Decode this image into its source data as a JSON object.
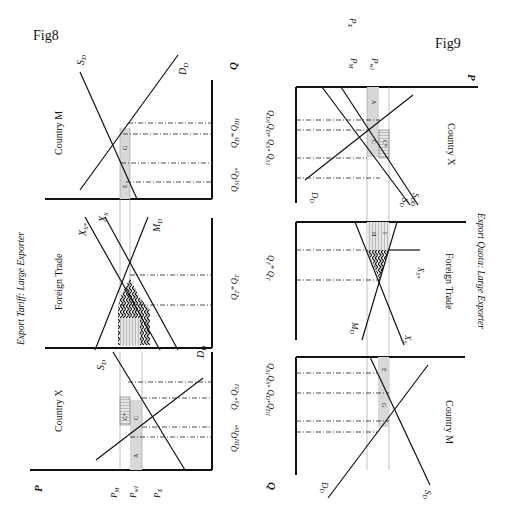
{
  "fig8": {
    "label": "Fig8",
    "title": "Export Tariff: Large Exporter",
    "panels": {
      "country_m": {
        "title": "Country M",
        "curves": [
          "S_D",
          "D_D"
        ],
        "areas": [
          "G",
          "E"
        ],
        "q_labels": [
          "Q_D1 Q_D*",
          "Q_S* Q_S1"
        ],
        "axis_q": "Q"
      },
      "foreign_trade": {
        "title": "Foreign Trade",
        "curves": [
          "X_S*",
          "X_S",
          "M_D"
        ],
        "areas": [
          "H",
          "I"
        ],
        "q_labels": [
          "Q_T* Q_T"
        ]
      },
      "country_x": {
        "title": "Country X",
        "curves": [
          "S_D",
          "D_D"
        ],
        "areas": [
          "A",
          "C",
          "C*"
        ],
        "q_labels": [
          "Q_D1 Q_D*",
          "Q_S* Q_S1"
        ],
        "axis_p": "P",
        "price_labels": [
          "P_M",
          "P_w1",
          "P_X"
        ]
      }
    },
    "text": {
      "fig": "Fig8",
      "title": "Export Tariff: Large Exporter",
      "cm": "Country M",
      "ft": "Foreign Trade",
      "cx": "Country X",
      "sd": "S",
      "dd": "D",
      "sub_d": "D",
      "xs": "X",
      "sub_s": "S",
      "sub_sstar": "S*",
      "md": "M",
      "q": "Q",
      "p": "P",
      "pm": "P",
      "pm_sub": "M",
      "pw": "P",
      "pw_sub": "w1",
      "px": "P",
      "px_sub": "X",
      "qm1": "Q_D* Q_D1",
      "qm2": "Q_S1 Q_S*",
      "qt": "Q_T* Q_T",
      "qx1": "Q_D1 Q_D*",
      "qx2": "Q_S* Q_S1",
      "a": "A",
      "c": "C",
      "cs": "C*",
      "e": "E",
      "g": "G",
      "h": "H",
      "i": "I"
    }
  },
  "fig9": {
    "label": "Fig9",
    "title": "Export Quota: Large Exporter",
    "text": {
      "fig": "Fig9",
      "title": "Export Quota: Large Exporter",
      "cx": "Country X",
      "ft": "Foreign Trade",
      "cm": "Country M",
      "p": "P",
      "q": "Q",
      "px": "P",
      "px_sub": "X",
      "pw": "P",
      "pw_sub": "w1",
      "pm": "P",
      "pm_sub": "M",
      "qx": "Q_D1 Q_D*  Q_S* Q_S1",
      "qt": "Q_T* Q_T",
      "qm": "Q_S1 Q_S*  Q_D* Q_D1",
      "sdd": "S_DD",
      "sd": "S_D",
      "dd": "D_D",
      "xs": "X_S",
      "xss": "X_S*",
      "md": "M_D",
      "a": "A",
      "c": "C",
      "cs": "C*",
      "e": "E",
      "g": "G",
      "h": "H",
      "i": "I"
    }
  }
}
